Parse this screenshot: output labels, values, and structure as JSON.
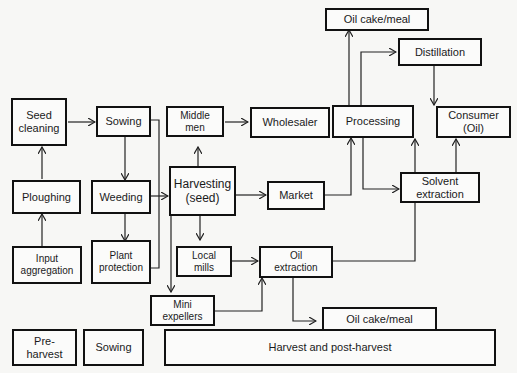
{
  "diagram": {
    "type": "flowchart",
    "title": "",
    "nodes": {
      "seed_cleaning": "Seed\ncleaning",
      "sowing": "Sowing",
      "middle_men": "Middle\nmen",
      "wholesaler": "Wholesaler",
      "processing": "Processing",
      "oil_cake_meal_top": "Oil cake/meal",
      "distillation": "Distillation",
      "consumer_oil": "Consumer\n(Oil)",
      "ploughing": "Ploughing",
      "weeding": "Weeding",
      "harvesting_seed": "Harvesting\n(seed)",
      "market": "Market",
      "solvent_extraction": "Solvent\nextraction",
      "input_aggregation": "Input\naggregation",
      "plant_protection": "Plant\nprotection",
      "local_mills": "Local\nmills",
      "oil_extraction": "Oil\nextraction",
      "mini_expellers": "Mini\nexpellers",
      "oil_cake_meal_bottom": "Oil cake/meal"
    },
    "legend": {
      "pre_harvest": "Pre-\nharvest",
      "sowing": "Sowing",
      "harvest_post_harvest": "Harvest and post-harvest"
    },
    "edges": [
      {
        "from": "Input aggregation",
        "to": "Ploughing"
      },
      {
        "from": "Ploughing",
        "to": "Seed cleaning"
      },
      {
        "from": "Seed cleaning",
        "to": "Sowing"
      },
      {
        "from": "Sowing",
        "to": "Weeding"
      },
      {
        "from": "Weeding",
        "to": "Plant protection"
      },
      {
        "from": "Weeding",
        "to": "Harvesting (seed)"
      },
      {
        "from": "Sowing",
        "to": "Harvesting (seed)"
      },
      {
        "from": "Plant protection",
        "to": "Harvesting (seed)"
      },
      {
        "from": "Harvesting (seed)",
        "to": "Middle men"
      },
      {
        "from": "Middle men",
        "to": "Wholesaler"
      },
      {
        "from": "Wholesaler",
        "to": "Processing"
      },
      {
        "from": "Harvesting (seed)",
        "to": "Market"
      },
      {
        "from": "Market",
        "to": "Processing"
      },
      {
        "from": "Harvesting (seed)",
        "to": "Local mills"
      },
      {
        "from": "Harvesting (seed)",
        "to": "Mini expellers"
      },
      {
        "from": "Local mills",
        "to": "Oil extraction"
      },
      {
        "from": "Mini expellers",
        "to": "Oil extraction"
      },
      {
        "from": "Processing",
        "to": "Oil cake/meal"
      },
      {
        "from": "Processing",
        "to": "Distillation"
      },
      {
        "from": "Processing",
        "to": "Solvent extraction"
      },
      {
        "from": "Distillation",
        "to": "Consumer (Oil)"
      },
      {
        "from": "Solvent extraction",
        "to": "Consumer (Oil)"
      },
      {
        "from": "Oil extraction",
        "to": "Consumer (Oil)"
      },
      {
        "from": "Oil extraction",
        "to": "Oil cake/meal"
      }
    ]
  }
}
